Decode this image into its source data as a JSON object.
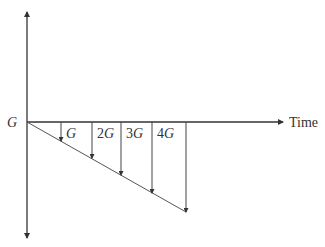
{
  "diagram": {
    "origin_label": "G",
    "x_axis_label": "Time",
    "colors": {
      "line": "#333333",
      "background": "#ffffff"
    },
    "arrows": [
      {
        "label_italic": "G",
        "label_coef": "",
        "x": 61,
        "tip_y": 141
      },
      {
        "label_italic": "G",
        "label_coef": "2",
        "x": 92,
        "tip_y": 158
      },
      {
        "label_italic": "G",
        "label_coef": "3",
        "x": 121,
        "tip_y": 175
      },
      {
        "label_italic": "G",
        "label_coef": "4",
        "x": 152,
        "tip_y": 193
      },
      {
        "label_italic": "",
        "label_coef": "",
        "x": 186,
        "tip_y": 212
      }
    ],
    "labels": {
      "a1": "G",
      "a2_coef": "2",
      "a2_var": "G",
      "a3_coef": "3",
      "a3_var": "G",
      "a4_coef": "4",
      "a4_var": "G"
    }
  }
}
